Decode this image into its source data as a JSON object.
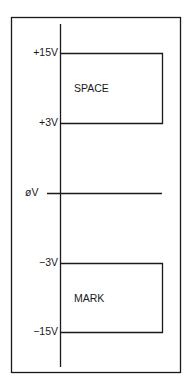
{
  "diagram": {
    "type": "voltage-level diagram",
    "axis_labels": {
      "plus15": "+15V",
      "plus3": "+3V",
      "zero": "øV",
      "minus3": "−3V",
      "minus15": "−15V"
    },
    "regions": {
      "space": "SPACE",
      "mark": "MARK"
    },
    "colors": {
      "line": "#1a1a1a",
      "background": "#ffffff"
    }
  }
}
